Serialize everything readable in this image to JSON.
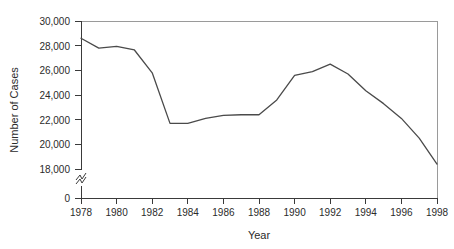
{
  "chart_data": {
    "type": "line",
    "title": "",
    "xlabel": "Year",
    "ylabel": "Number of Cases",
    "x": [
      1978,
      1979,
      1980,
      1981,
      1982,
      1983,
      1984,
      1985,
      1986,
      1987,
      1988,
      1989,
      1990,
      1991,
      1992,
      1993,
      1994,
      1995,
      1996,
      1997,
      1998
    ],
    "values": [
      28600,
      27800,
      27950,
      27650,
      25800,
      21700,
      21700,
      22100,
      22350,
      22400,
      22400,
      23600,
      25600,
      25900,
      26500,
      25700,
      24350,
      23300,
      22100,
      20500,
      18400
    ],
    "series": [
      {
        "name": "Number of Cases",
        "values": [
          28600,
          27800,
          27950,
          27650,
          25800,
          21700,
          21700,
          22100,
          22350,
          22400,
          22400,
          23600,
          25600,
          25900,
          26500,
          25700,
          24350,
          23300,
          22100,
          20500,
          18400
        ]
      }
    ],
    "xlim": [
      1977.5,
      1998.5
    ],
    "ylim": [
      18000,
      30000
    ],
    "y_axis_break": true,
    "y_break_between": [
      0,
      18000
    ],
    "y_zero_label": "0",
    "grid": false,
    "legend": false,
    "legend_position": "none",
    "line_color": "#4a4a4a",
    "y_tick_labels": [
      "30,000",
      "28,000",
      "26,000",
      "24,000",
      "22,000",
      "20,000",
      "18,000",
      "0"
    ],
    "y_tick_values": [
      30000,
      28000,
      26000,
      24000,
      22000,
      20000,
      18000,
      0
    ],
    "x_tick_labels": [
      "1978",
      "1980",
      "1982",
      "1984",
      "1986",
      "1988",
      "1990",
      "1992",
      "1994",
      "1996",
      "1998"
    ],
    "x_tick_values": [
      1978,
      1980,
      1982,
      1984,
      1986,
      1988,
      1990,
      1992,
      1994,
      1996,
      1998
    ]
  }
}
